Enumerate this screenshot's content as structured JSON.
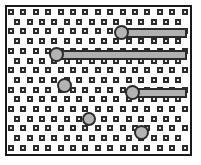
{
  "figure": {
    "type": "lattice-diagram",
    "title": "",
    "canvas": {
      "width": 201,
      "height": 165,
      "background": "#ffffff"
    },
    "frame": {
      "x": 5,
      "y": 5,
      "width": 187,
      "height": 151,
      "border_width": 2,
      "border_color": "#1a1a1a",
      "fill": "#ffffff"
    },
    "colors": {
      "site_fill": "#e8e8e8",
      "site_stroke": "#2b2b2b",
      "particle_fill": "#b3b3b3",
      "particle_stroke": "#2b2b2b",
      "rod_fill": "#b0b0b0",
      "rod_stroke": "#2b2b2b",
      "frame_stroke": "#1a1a1a",
      "background": "#ffffff"
    },
    "lattice": {
      "site_size": 6,
      "site_stroke_width": 2,
      "column_spacing": 12.4,
      "row_spacing": 9.7,
      "row_offset": 6.2,
      "origin_x": 11,
      "origin_y": 12,
      "rows": 15,
      "columns_even_row": 15,
      "columns_odd_row": 14,
      "arrangement": "staggered-brick"
    },
    "rods": [
      {
        "label": "rod-1",
        "head_cx": 121.5,
        "head_cy": 32.5,
        "head_r": 7.5,
        "bar_x": 126,
        "bar_y": 27.5,
        "bar_width": 61,
        "bar_height": 10,
        "orientation": "horizontal"
      },
      {
        "label": "rod-2",
        "head_cx": 56.5,
        "head_cy": 54.5,
        "head_r": 7.5,
        "bar_x": 61,
        "bar_y": 49.5,
        "bar_width": 126,
        "bar_height": 10,
        "orientation": "horizontal"
      },
      {
        "label": "rod-3",
        "head_cx": 132.5,
        "head_cy": 92.5,
        "head_r": 7.5,
        "bar_x": 137,
        "bar_y": 87.5,
        "bar_width": 50,
        "bar_height": 10,
        "orientation": "horizontal"
      }
    ],
    "free_particles": [
      {
        "label": "particle-1",
        "cx": 64.0,
        "cy": 85.5,
        "r": 7.5
      },
      {
        "label": "particle-2",
        "cx": 89.0,
        "cy": 119.0,
        "r": 7.0
      },
      {
        "label": "particle-3",
        "cx": 141.0,
        "cy": 132.0,
        "r": 7.5
      }
    ],
    "particle_stroke_width": 2,
    "rod_stroke_width": 2
  }
}
